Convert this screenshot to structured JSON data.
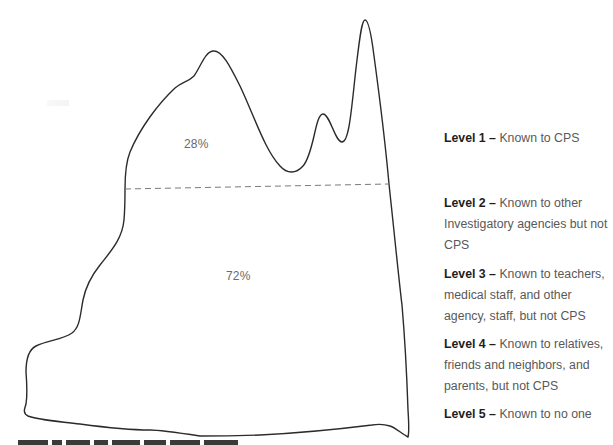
{
  "diagram": {
    "type": "iceberg",
    "outline_color": "#2b2b2b",
    "divider_color": "#7a7a7a",
    "upper_section": {
      "percent_label": "28%"
    },
    "lower_section": {
      "percent_label": "72%"
    }
  },
  "legend": {
    "items": [
      {
        "level": "Level 1",
        "dash": " – ",
        "text": "Known to CPS"
      },
      {
        "level": "Level 2",
        "dash": " – ",
        "text": "Known to other Investigatory agencies but not CPS"
      },
      {
        "level": "Level 3",
        "dash": " – ",
        "text": "Known to teachers, medical staff, and other agency, staff, but not CPS"
      },
      {
        "level": "Level 4",
        "dash": " – ",
        "text": "Known to relatives, friends and neighbors, and parents, but not CPS"
      },
      {
        "level": "Level 5",
        "dash": " – ",
        "text": "Known to no one"
      }
    ]
  },
  "colors": {
    "label_bold": "#1e1e1e",
    "label_regular": "#595959",
    "percent_text": "#6a6a6a"
  }
}
